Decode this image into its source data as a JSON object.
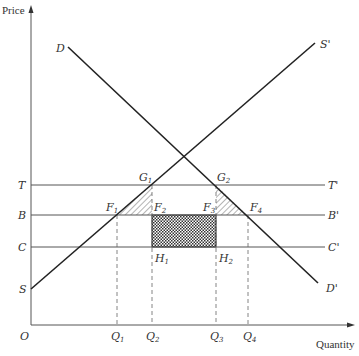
{
  "diagram": {
    "type": "supply-demand",
    "axes": {
      "y_label": "Price",
      "x_label": "Quantity",
      "origin": "O"
    },
    "curves": {
      "demand": {
        "start_label": "D",
        "end_label": "D'"
      },
      "supply": {
        "start_label": "S",
        "end_label": "S'"
      }
    },
    "price_lines": [
      {
        "left": "T",
        "right": "T'"
      },
      {
        "left": "B",
        "right": "B'"
      },
      {
        "left": "C",
        "right": "C'"
      }
    ],
    "points": {
      "G1": {
        "letter": "G",
        "sub": "1"
      },
      "G2": {
        "letter": "G",
        "sub": "2"
      },
      "F1": {
        "letter": "F",
        "sub": "1"
      },
      "F2": {
        "letter": "F",
        "sub": "2"
      },
      "F3": {
        "letter": "F",
        "sub": "3"
      },
      "F4": {
        "letter": "F",
        "sub": "4"
      },
      "H1": {
        "letter": "H",
        "sub": "1"
      },
      "H2": {
        "letter": "H",
        "sub": "2"
      }
    },
    "quantities": [
      {
        "letter": "Q",
        "sub": "1"
      },
      {
        "letter": "Q",
        "sub": "2"
      },
      {
        "letter": "Q",
        "sub": "3"
      },
      {
        "letter": "Q",
        "sub": "4"
      }
    ],
    "shaded_regions": [
      {
        "name": "triangle G1-F1-F2",
        "pattern": "diagonal-hatch"
      },
      {
        "name": "triangle G2-F3-F4",
        "pattern": "diagonal-hatch"
      },
      {
        "name": "rectangle F2-F3-H2-H1",
        "pattern": "crosshatch"
      }
    ]
  }
}
